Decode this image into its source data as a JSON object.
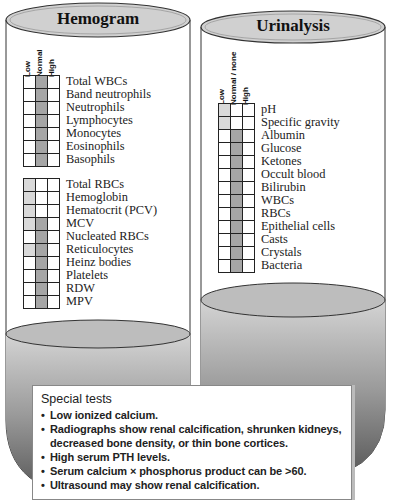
{
  "hemogram": {
    "title": "Hemogram",
    "columns": [
      "Low",
      "Normal",
      "High"
    ],
    "wbc_panel": [
      {
        "label": "Total WBCs",
        "marks": [
          "",
          "normal",
          ""
        ]
      },
      {
        "label": "Band neutrophils",
        "marks": [
          "",
          "normal",
          ""
        ]
      },
      {
        "label": "Neutrophils",
        "marks": [
          "",
          "normal",
          ""
        ]
      },
      {
        "label": "Lymphocytes",
        "marks": [
          "",
          "normal",
          ""
        ]
      },
      {
        "label": "Monocytes",
        "marks": [
          "",
          "normal",
          ""
        ]
      },
      {
        "label": "Eosinophils",
        "marks": [
          "",
          "normal",
          ""
        ]
      },
      {
        "label": "Basophils",
        "marks": [
          "",
          "normal",
          ""
        ]
      }
    ],
    "rbc_panel": [
      {
        "label": "Total RBCs",
        "marks": [
          "low",
          "",
          ""
        ]
      },
      {
        "label": "Hemoglobin",
        "marks": [
          "low",
          "",
          ""
        ]
      },
      {
        "label": "Hematocrit (PCV)",
        "marks": [
          "low",
          "",
          ""
        ]
      },
      {
        "label": "MCV",
        "marks": [
          "low",
          "normal",
          ""
        ]
      },
      {
        "label": "Nucleated RBCs",
        "marks": [
          "",
          "normal",
          ""
        ]
      },
      {
        "label": "Reticulocytes",
        "marks": [
          "low",
          "normal",
          ""
        ]
      },
      {
        "label": "Heinz bodies",
        "marks": [
          "",
          "normal",
          ""
        ]
      },
      {
        "label": "Platelets",
        "marks": [
          "",
          "normal",
          ""
        ]
      },
      {
        "label": "RDW",
        "marks": [
          "",
          "normal",
          ""
        ]
      },
      {
        "label": "MPV",
        "marks": [
          "",
          "normal",
          ""
        ]
      }
    ]
  },
  "urinalysis": {
    "title": "Urinalysis",
    "columns": [
      "Low",
      "Normal / none",
      "High"
    ],
    "rows": [
      {
        "label": "pH",
        "marks": [
          "low",
          "",
          ""
        ]
      },
      {
        "label": "Specific gravity",
        "marks": [
          "low",
          "",
          ""
        ]
      },
      {
        "label": "Albumin",
        "marks": [
          "",
          "normal",
          ""
        ]
      },
      {
        "label": "Glucose",
        "marks": [
          "",
          "normal",
          ""
        ]
      },
      {
        "label": "Ketones",
        "marks": [
          "",
          "normal",
          ""
        ]
      },
      {
        "label": "Occult blood",
        "marks": [
          "",
          "normal",
          ""
        ]
      },
      {
        "label": "Bilirubin",
        "marks": [
          "",
          "normal",
          ""
        ]
      },
      {
        "label": "WBCs",
        "marks": [
          "",
          "normal",
          ""
        ]
      },
      {
        "label": "RBCs",
        "marks": [
          "",
          "normal",
          ""
        ]
      },
      {
        "label": "Epithelial cells",
        "marks": [
          "",
          "normal",
          ""
        ]
      },
      {
        "label": "Casts",
        "marks": [
          "",
          "normal",
          ""
        ]
      },
      {
        "label": "Crystals",
        "marks": [
          "",
          "normal",
          ""
        ]
      },
      {
        "label": "Bacteria",
        "marks": [
          "",
          "normal",
          ""
        ]
      }
    ]
  },
  "special_tests": {
    "heading": "Special tests",
    "bullet": "•",
    "items": [
      "Low ionized calcium.",
      "Radiographs show renal calcification, shrunken kidneys, decreased bone density, or thin bone cortices.",
      "High serum PTH levels.",
      "Serum calcium × phosphorus product can be >60.",
      "Ultrasound may show renal calcification."
    ]
  },
  "colors": {
    "low_shade": "#d9d9d9",
    "normal_shade": "#a6a6a6",
    "lid": "#d0d0d0",
    "liquid_top": "#c4c4c4",
    "liquid_bottom": "#5a5a5a"
  }
}
